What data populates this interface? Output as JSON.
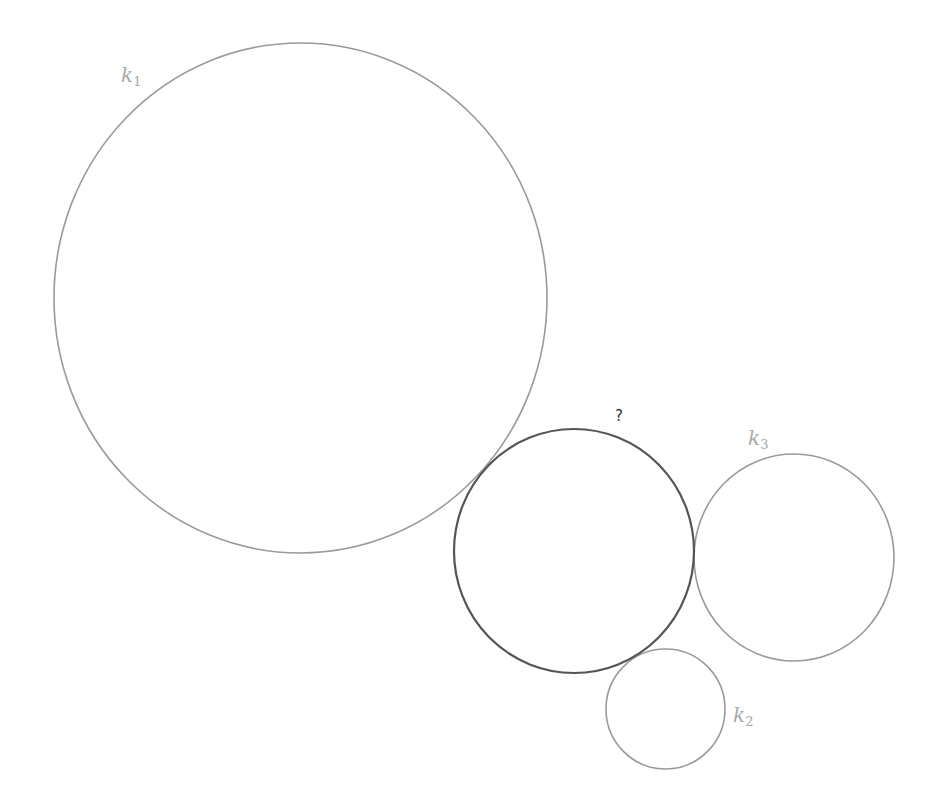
{
  "diagram": {
    "colors": {
      "known_stroke": "#9a9a9a",
      "unknown_stroke": "#555555",
      "label": "#a8a8a8",
      "question": "#333333",
      "background": "#ffffff"
    },
    "circles": [
      {
        "id": "k1",
        "cx": 300.5,
        "cy": 298,
        "rx": 246.5,
        "ry": 255,
        "role": "known"
      },
      {
        "id": "unknown",
        "cx": 574,
        "cy": 551,
        "rx": 120,
        "ry": 122,
        "role": "unknown"
      },
      {
        "id": "k3",
        "cx": 794,
        "cy": 557.5,
        "rx": 100,
        "ry": 103.5,
        "role": "known"
      },
      {
        "id": "k2",
        "cx": 665.5,
        "cy": 709,
        "rx": 59.5,
        "ry": 60,
        "role": "known"
      }
    ],
    "labels": {
      "k1": {
        "base": "k",
        "sub": "1"
      },
      "k2": {
        "base": "k",
        "sub": "2"
      },
      "k3": {
        "base": "k",
        "sub": "3"
      },
      "unknown": "?"
    }
  }
}
